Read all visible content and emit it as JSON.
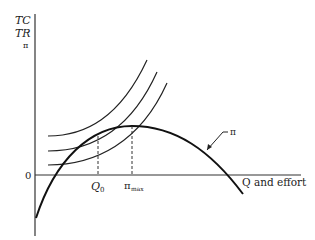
{
  "diagram": {
    "type": "economics-isoprofit",
    "y_axis_labels": [
      "TC",
      "TR",
      "π"
    ],
    "origin_label": "0",
    "x_axis_label": "Q and effort",
    "x_ticks": [
      {
        "label": "Q",
        "sub": "0"
      },
      {
        "label": "π",
        "sub": "max"
      }
    ],
    "curves": [
      {
        "name": "profit-curve",
        "label": "π",
        "shape": "inverted parabola, peak at π_max"
      },
      {
        "name": "isoprofit-curve-1",
        "shape": "convex rising"
      },
      {
        "name": "isoprofit-curve-2",
        "shape": "convex rising, tangent-ish crossing at Q0"
      },
      {
        "name": "isoprofit-curve-3",
        "shape": "convex rising, tangent to π at π_max"
      }
    ],
    "colors": {
      "ink": "#222222",
      "background": "#ffffff"
    }
  }
}
